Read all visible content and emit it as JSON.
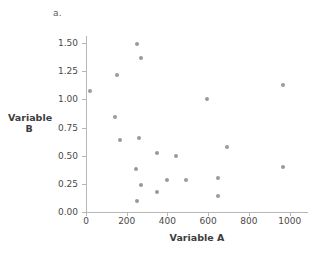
{
  "panel": {
    "label": "a."
  },
  "chart_data": {
    "type": "scatter",
    "title": "",
    "subtitle": "",
    "xlabel": "Variable A",
    "ylabel": "Variable B",
    "ylabel_lines": [
      "Variable",
      "B"
    ],
    "xlim": [
      0,
      1090
    ],
    "ylim": [
      0.0,
      1.58
    ],
    "xticks": [
      0,
      200,
      400,
      600,
      800,
      1000
    ],
    "xticklabels": [
      "0",
      "200",
      "400",
      "600",
      "800",
      "1000"
    ],
    "yticks": [
      0.0,
      0.25,
      0.5,
      0.75,
      1.0,
      1.25,
      1.5
    ],
    "yticklabels": [
      "0.00",
      "0.25",
      "0.50",
      "0.75",
      "1.00",
      "1.25",
      "1.50"
    ],
    "grid": false,
    "legend": null,
    "marker_color": "#9a9a9a",
    "axis_color": "#b7b7b7",
    "points": [
      {
        "x": 20,
        "y": 1.07
      },
      {
        "x": 150,
        "y": 1.22
      },
      {
        "x": 140,
        "y": 0.84
      },
      {
        "x": 165,
        "y": 0.64
      },
      {
        "x": 248,
        "y": 1.49
      },
      {
        "x": 268,
        "y": 1.37
      },
      {
        "x": 262,
        "y": 0.66
      },
      {
        "x": 245,
        "y": 0.38
      },
      {
        "x": 268,
        "y": 0.24
      },
      {
        "x": 248,
        "y": 0.1
      },
      {
        "x": 350,
        "y": 0.52
      },
      {
        "x": 350,
        "y": 0.18
      },
      {
        "x": 400,
        "y": 0.28
      },
      {
        "x": 440,
        "y": 0.5
      },
      {
        "x": 490,
        "y": 0.28
      },
      {
        "x": 595,
        "y": 1.0
      },
      {
        "x": 650,
        "y": 0.3
      },
      {
        "x": 650,
        "y": 0.14
      },
      {
        "x": 690,
        "y": 0.58
      },
      {
        "x": 965,
        "y": 1.13
      },
      {
        "x": 965,
        "y": 0.4
      }
    ]
  }
}
